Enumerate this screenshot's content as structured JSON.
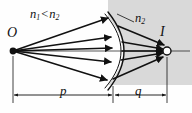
{
  "figure": {
    "type": "optics-ray-diagram",
    "background_color": "#fefefe",
    "shading_color": "#d9d9d9",
    "ink_color": "#111111",
    "labels": {
      "index_compare": {
        "n_first": "n",
        "n_first_sub": "1",
        "relation": "<",
        "n_second": "n",
        "n_second_sub": "2"
      },
      "medium_right": {
        "symbol": "n",
        "subscript": "2"
      },
      "object_point": "O",
      "image_point": "I",
      "object_distance": "p",
      "image_distance": "q"
    },
    "geometry": {
      "object_x": 13,
      "object_y": 51,
      "image_x": 167,
      "image_y": 51,
      "vertex_x": 113,
      "axis_y": 51,
      "dimension_line_y": 95,
      "ray_count": 5
    }
  }
}
